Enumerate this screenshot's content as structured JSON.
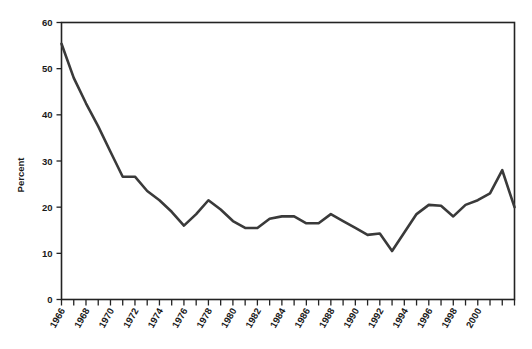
{
  "figure": {
    "background_color": "#ffffff",
    "line_color": "#3a3a3a",
    "axis_color": "#232323"
  },
  "chart_data": {
    "type": "line",
    "title": "",
    "subtitle": "",
    "xlabel": "",
    "ylabel": "Percent",
    "xlim": [
      1966,
      2003
    ],
    "ylim": [
      0,
      60
    ],
    "grid": false,
    "legend": null,
    "legend_position": "none",
    "yticks": [
      0,
      10,
      20,
      30,
      40,
      50,
      60
    ],
    "ytick_labels": [
      "0",
      "10",
      "20",
      "30",
      "40",
      "50",
      "60"
    ],
    "xticks": [
      1966,
      1967,
      1968,
      1969,
      1970,
      1971,
      1972,
      1973,
      1974,
      1975,
      1976,
      1977,
      1978,
      1979,
      1980,
      1981,
      1982,
      1983,
      1984,
      1985,
      1986,
      1987,
      1988,
      1989,
      1990,
      1991,
      1992,
      1993,
      1994,
      1995,
      1996,
      1997,
      1998,
      1999,
      2000,
      2001,
      2002,
      2003
    ],
    "xtick_labels": [
      "1966",
      "",
      "1968",
      "",
      "1970",
      "",
      "1972",
      "",
      "1974",
      "",
      "1976",
      "",
      "1978",
      "",
      "1980",
      "",
      "1982",
      "",
      "1984",
      "",
      "1986",
      "",
      "1988",
      "",
      "1990",
      "",
      "1992",
      "",
      "1994",
      "",
      "1996",
      "",
      "1998",
      "",
      "2000",
      "",
      "",
      ""
    ],
    "x": [
      1966,
      1967,
      1968,
      1969,
      1970,
      1971,
      1972,
      1973,
      1974,
      1975,
      1976,
      1977,
      1978,
      1979,
      1980,
      1981,
      1982,
      1983,
      1984,
      1985,
      1986,
      1987,
      1988,
      1989,
      1990,
      1991,
      1992,
      1993,
      1994,
      1995,
      1996,
      1997,
      1998,
      1999,
      2000,
      2001,
      2002,
      2003
    ],
    "values": [
      55.4,
      48.0,
      42.5,
      37.5,
      32.0,
      26.6,
      26.6,
      23.5,
      21.5,
      19.0,
      16.0,
      18.5,
      21.5,
      19.5,
      17.0,
      15.5,
      15.5,
      17.5,
      18.0,
      18.0,
      16.5,
      16.5,
      18.5,
      17.0,
      15.5,
      14.0,
      14.3,
      10.5,
      14.5,
      18.5,
      20.5,
      20.3,
      18.0,
      20.5,
      21.5,
      23.0,
      28.0,
      20.0
    ],
    "annotations": []
  }
}
